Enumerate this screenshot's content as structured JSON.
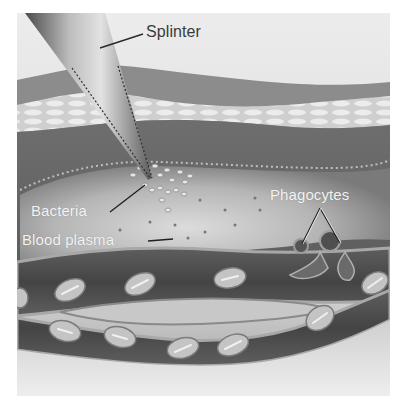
{
  "figure": {
    "labels": {
      "splinter": "Splinter",
      "bacteria": "Bacteria",
      "blood_plasma": "Blood plasma",
      "phagocytes": "Phagocytes"
    },
    "colors": {
      "background": "#ffffff",
      "sky": "#e6e6e6",
      "epidermis_top": "#8f8f8f",
      "epidermis_cells": "#dedede",
      "dermis": "#6a6a6a",
      "tissue_fluid": "#c9c9c9",
      "vessel_wall": "#9a9a9a",
      "vessel_lumen": "#4f4f4f",
      "red_cell": "#bdbdbd",
      "splinter_light": "#d8d8d8",
      "splinter_dark": "#5a5a5a",
      "label_dark": "#3a3a3a",
      "label_light": "#f4f4f4"
    }
  }
}
